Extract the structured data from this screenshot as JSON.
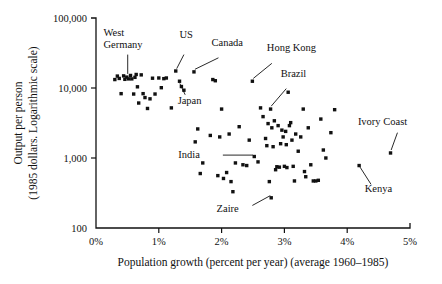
{
  "chart_data": {
    "type": "scatter",
    "title": "",
    "xlabel": "Population growth (percent per year)  (average 1960–1985)",
    "xlabel_part1": "Population growth (percent per year)",
    "xlabel_part2": "(average 1960–1985)",
    "ylabel": "Output per person",
    "ylabel_line2": "(1985 dollars. Logarithmic scale)",
    "xlim": [
      0,
      5
    ],
    "ylim": [
      100,
      100000
    ],
    "yscale": "log",
    "xscale": "linear",
    "grid": false,
    "legend": "none",
    "xticks": [
      "0%",
      "1%",
      "2%",
      "3%",
      "4%",
      "5%"
    ],
    "xtick_values": [
      0,
      1,
      2,
      3,
      4,
      5
    ],
    "yticks": [
      "100",
      "1,000",
      "10,000",
      "100,000"
    ],
    "ytick_values": [
      100,
      1000,
      10000,
      100000
    ],
    "marker": "square",
    "marker_color": "#111111",
    "annotations": [
      {
        "name": "West Germany",
        "label_line1": "West",
        "label_line2": "Germany",
        "x": 0.52,
        "y": 13500
      },
      {
        "name": "US",
        "label_line1": "US",
        "x": 1.27,
        "y": 17500
      },
      {
        "name": "Canada",
        "label_line1": "Canada",
        "x": 1.56,
        "y": 17000
      },
      {
        "name": "Hong Kong",
        "label_line1": "Hong Kong",
        "x": 2.49,
        "y": 12500
      },
      {
        "name": "Brazil",
        "label_line1": "Brazil",
        "x": 2.78,
        "y": 5000
      },
      {
        "name": "Japan",
        "label_line1": "Japan",
        "x": 1.33,
        "y": 12500
      },
      {
        "name": "India",
        "label_line1": "India",
        "x": 2.52,
        "y": 1050
      },
      {
        "name": "Zaire",
        "label_line1": "Zaire",
        "x": 2.79,
        "y": 270
      },
      {
        "name": "Ivory Coast",
        "label_line1": "Ivory Coast",
        "x": 4.69,
        "y": 1180
      },
      {
        "name": "Kenya",
        "label_line1": "Kenya",
        "x": 4.19,
        "y": 780
      }
    ],
    "points": [
      [
        0.3,
        13200
      ],
      [
        0.34,
        14800
      ],
      [
        0.37,
        13700
      ],
      [
        0.4,
        8300
      ],
      [
        0.44,
        14900
      ],
      [
        0.46,
        13300
      ],
      [
        0.49,
        14300
      ],
      [
        0.52,
        13500
      ],
      [
        0.55,
        15100
      ],
      [
        0.57,
        13500
      ],
      [
        0.6,
        8200
      ],
      [
        0.62,
        14200
      ],
      [
        0.64,
        15600
      ],
      [
        0.66,
        10400
      ],
      [
        0.68,
        6100
      ],
      [
        0.72,
        15400
      ],
      [
        0.75,
        8300
      ],
      [
        0.78,
        7300
      ],
      [
        0.82,
        5100
      ],
      [
        0.86,
        7000
      ],
      [
        0.9,
        13800
      ],
      [
        0.94,
        8200
      ],
      [
        1.0,
        13900
      ],
      [
        1.04,
        10100
      ],
      [
        1.08,
        13600
      ],
      [
        1.12,
        13900
      ],
      [
        1.2,
        5200
      ],
      [
        1.27,
        17500
      ],
      [
        1.33,
        12500
      ],
      [
        1.36,
        10500
      ],
      [
        1.4,
        9300
      ],
      [
        1.56,
        17000
      ],
      [
        1.58,
        1700
      ],
      [
        1.62,
        2600
      ],
      [
        1.66,
        600
      ],
      [
        1.7,
        850
      ],
      [
        1.82,
        2100
      ],
      [
        1.86,
        13200
      ],
      [
        1.9,
        12700
      ],
      [
        1.94,
        560
      ],
      [
        1.97,
        2000
      ],
      [
        2.0,
        5000
      ],
      [
        2.03,
        510
      ],
      [
        2.08,
        620
      ],
      [
        2.12,
        2200
      ],
      [
        2.15,
        460
      ],
      [
        2.18,
        330
      ],
      [
        2.22,
        850
      ],
      [
        2.28,
        2800
      ],
      [
        2.34,
        800
      ],
      [
        2.4,
        780
      ],
      [
        2.44,
        1800
      ],
      [
        2.49,
        12500
      ],
      [
        2.52,
        1050
      ],
      [
        2.58,
        880
      ],
      [
        2.62,
        5200
      ],
      [
        2.66,
        3900
      ],
      [
        2.7,
        1900
      ],
      [
        2.72,
        1500
      ],
      [
        2.74,
        3100
      ],
      [
        2.76,
        460
      ],
      [
        2.78,
        5000
      ],
      [
        2.79,
        270
      ],
      [
        2.8,
        2700
      ],
      [
        2.82,
        1450
      ],
      [
        2.84,
        3400
      ],
      [
        2.86,
        680
      ],
      [
        2.88,
        750
      ],
      [
        2.9,
        2900
      ],
      [
        2.92,
        740
      ],
      [
        2.94,
        1600
      ],
      [
        2.96,
        2500
      ],
      [
        2.98,
        2000
      ],
      [
        3.0,
        760
      ],
      [
        3.02,
        2400
      ],
      [
        3.03,
        1550
      ],
      [
        3.04,
        730
      ],
      [
        3.06,
        8700
      ],
      [
        3.08,
        2900
      ],
      [
        3.1,
        3200
      ],
      [
        3.12,
        1800
      ],
      [
        3.14,
        760
      ],
      [
        3.16,
        470
      ],
      [
        3.18,
        2200
      ],
      [
        3.22,
        1250
      ],
      [
        3.26,
        2000
      ],
      [
        3.3,
        5000
      ],
      [
        3.32,
        640
      ],
      [
        3.34,
        540
      ],
      [
        3.38,
        2700
      ],
      [
        3.42,
        800
      ],
      [
        3.46,
        470
      ],
      [
        3.5,
        470
      ],
      [
        3.54,
        480
      ],
      [
        3.58,
        3600
      ],
      [
        3.62,
        1300
      ],
      [
        3.66,
        1000
      ],
      [
        3.74,
        2300
      ],
      [
        3.8,
        4900
      ],
      [
        4.19,
        780
      ],
      [
        4.69,
        1180
      ]
    ]
  },
  "annotation_leaders": [
    {
      "name": "west-germany-leader",
      "x1": 0.505,
      "y1": 30000,
      "x2": 0.505,
      "y2": 15900
    },
    {
      "name": "us-leader",
      "x1": 1.4,
      "y1": 30000,
      "x2": 1.285,
      "y2": 18900
    },
    {
      "name": "canada-leader",
      "x1": 1.95,
      "y1": 27000,
      "x2": 1.575,
      "y2": 18500
    },
    {
      "name": "hong-kong-leader",
      "x1": 2.8,
      "y1": 22500,
      "x2": 2.505,
      "y2": 13700
    },
    {
      "name": "brazil-leader",
      "x1": 3.03,
      "y1": 9800,
      "x2": 2.79,
      "y2": 5500
    },
    {
      "name": "japan-leader",
      "x1": 1.42,
      "y1": 8000,
      "x2": 1.335,
      "y2": 11600
    },
    {
      "name": "india-leader",
      "x1": 2.02,
      "y1": 1100,
      "x2": 2.5,
      "y2": 1100
    },
    {
      "name": "zaire-leader",
      "x1": 2.49,
      "y1": 210,
      "x2": 2.775,
      "y2": 290
    },
    {
      "name": "ivory-coast-leader",
      "x1": 4.8,
      "y1": 2300,
      "x2": 4.7,
      "y2": 1300
    },
    {
      "name": "kenya-leader",
      "x1": 4.38,
      "y1": 420,
      "x2": 4.205,
      "y2": 740
    }
  ],
  "annotation_text_positions": [
    {
      "name": "west-germany",
      "x": 0.12,
      "y": 55000,
      "anchor": "start",
      "lines": [
        "West",
        "Germany"
      ]
    },
    {
      "name": "us",
      "x": 1.33,
      "y": 52000,
      "anchor": "start",
      "lines": [
        "US"
      ]
    },
    {
      "name": "canada",
      "x": 1.84,
      "y": 40000,
      "anchor": "start",
      "lines": [
        "Canada"
      ]
    },
    {
      "name": "hong-kong",
      "x": 2.72,
      "y": 34000,
      "anchor": "start",
      "lines": [
        "Hong Kong"
      ]
    },
    {
      "name": "brazil",
      "x": 2.94,
      "y": 14500,
      "anchor": "start",
      "lines": [
        "Brazil"
      ]
    },
    {
      "name": "japan",
      "x": 1.3,
      "y": 5900,
      "anchor": "start",
      "lines": [
        "Japan"
      ]
    },
    {
      "name": "india",
      "x": 1.31,
      "y": 990,
      "anchor": "start",
      "lines": [
        "India"
      ]
    },
    {
      "name": "zaire",
      "x": 1.92,
      "y": 170,
      "anchor": "start",
      "lines": [
        "Zaire"
      ]
    },
    {
      "name": "ivory-coast",
      "x": 4.17,
      "y": 3000,
      "anchor": "start",
      "lines": [
        "Ivory Coast"
      ]
    },
    {
      "name": "kenya",
      "x": 4.28,
      "y": 330,
      "anchor": "start",
      "lines": [
        "Kenya"
      ]
    }
  ]
}
